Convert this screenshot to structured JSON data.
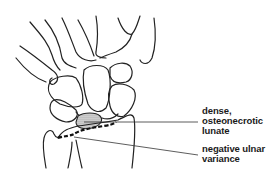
{
  "diagram": {
    "annotations": [
      {
        "id": "lunate",
        "lines": [
          "dense,",
          "osteonecrotic",
          "lunate"
        ]
      },
      {
        "id": "ulnar-variance",
        "lines": [
          "negative ulnar",
          "variance"
        ]
      }
    ],
    "colors": {
      "stroke": "#222222",
      "background": "#ffffff",
      "lunate_fill": "#bbbbbb"
    }
  }
}
